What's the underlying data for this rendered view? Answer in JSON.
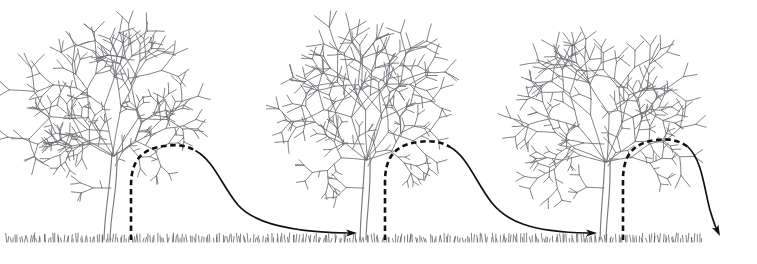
{
  "figure": {
    "caption": "",
    "width": 757,
    "height": 264,
    "background_color": "#ffffff"
  },
  "style": {
    "tree_line_color": "#6d6d72",
    "trunk_color": "#7a7a80",
    "grass_color": "#4a4a4f",
    "path_color": "#111111",
    "dash_pattern": "5.5 3.6",
    "dashed_stroke_width": 2.6,
    "solid_stroke_width": 1.7
  },
  "ground": {
    "baseline_y": 240,
    "grass_start_x": 6,
    "grass_end_x": 702,
    "blade_count": 300,
    "blade_min_height": 3,
    "blade_max_height": 9
  },
  "trees": [
    {
      "id": "tree-1",
      "label": "Tree 1",
      "trunk_base_x": 104,
      "trunk_base_y": 240,
      "canopy_center_x": 113,
      "canopy_top_y": 22,
      "canopy_left_x": 35,
      "canopy_right_x": 192,
      "canopy_bottom_y": 152,
      "scale": 1.0
    },
    {
      "id": "tree-2",
      "label": "Tree 2",
      "trunk_base_x": 360,
      "trunk_base_y": 240,
      "canopy_center_x": 366,
      "canopy_top_y": 26,
      "canopy_left_x": 288,
      "canopy_right_x": 444,
      "canopy_bottom_y": 156,
      "scale": 0.99
    },
    {
      "id": "tree-3",
      "label": "Tree 3",
      "trunk_base_x": 600,
      "trunk_base_y": 240,
      "canopy_center_x": 606,
      "canopy_top_y": 28,
      "canopy_left_x": 528,
      "canopy_right_x": 682,
      "canopy_bottom_y": 158,
      "scale": 0.97
    }
  ],
  "paths": [
    {
      "id": "path-1",
      "label": "Dispersal path from tree 1 to tree 2",
      "dashed_segment": "M 131 240 L 131 186 C 131 160 142 149 164 146 C 178 144 188 146 196 151",
      "solid_segment": "M 196 151 C 214 161 222 186 238 205 C 252 221 284 232 348 233",
      "arrow_tip_x": 357,
      "arrow_tip_y": 233,
      "arrow_angle_deg": 0,
      "has_arrowhead": true
    },
    {
      "id": "path-2",
      "label": "Dispersal path from tree 2 to tree 3",
      "dashed_segment": "M 385 240 L 385 182 C 385 156 396 145 418 142 C 432 140 442 142 450 147",
      "solid_segment": "M 450 147 C 468 157 476 183 492 203 C 506 220 528 232 588 233",
      "arrow_tip_x": 597,
      "arrow_tip_y": 233,
      "arrow_angle_deg": 0,
      "has_arrowhead": true
    },
    {
      "id": "path-3",
      "label": "Dispersal path leaving tree 3",
      "dashed_segment": "M 623 240 L 623 180 C 623 154 634 143 656 140 C 670 138 680 141 688 147",
      "solid_segment": "M 688 147 C 702 160 704 188 710 210 C 713 220 715 226 717 230",
      "arrow_tip_x": 720,
      "arrow_tip_y": 236,
      "arrow_angle_deg": 64,
      "has_arrowhead": true
    }
  ]
}
